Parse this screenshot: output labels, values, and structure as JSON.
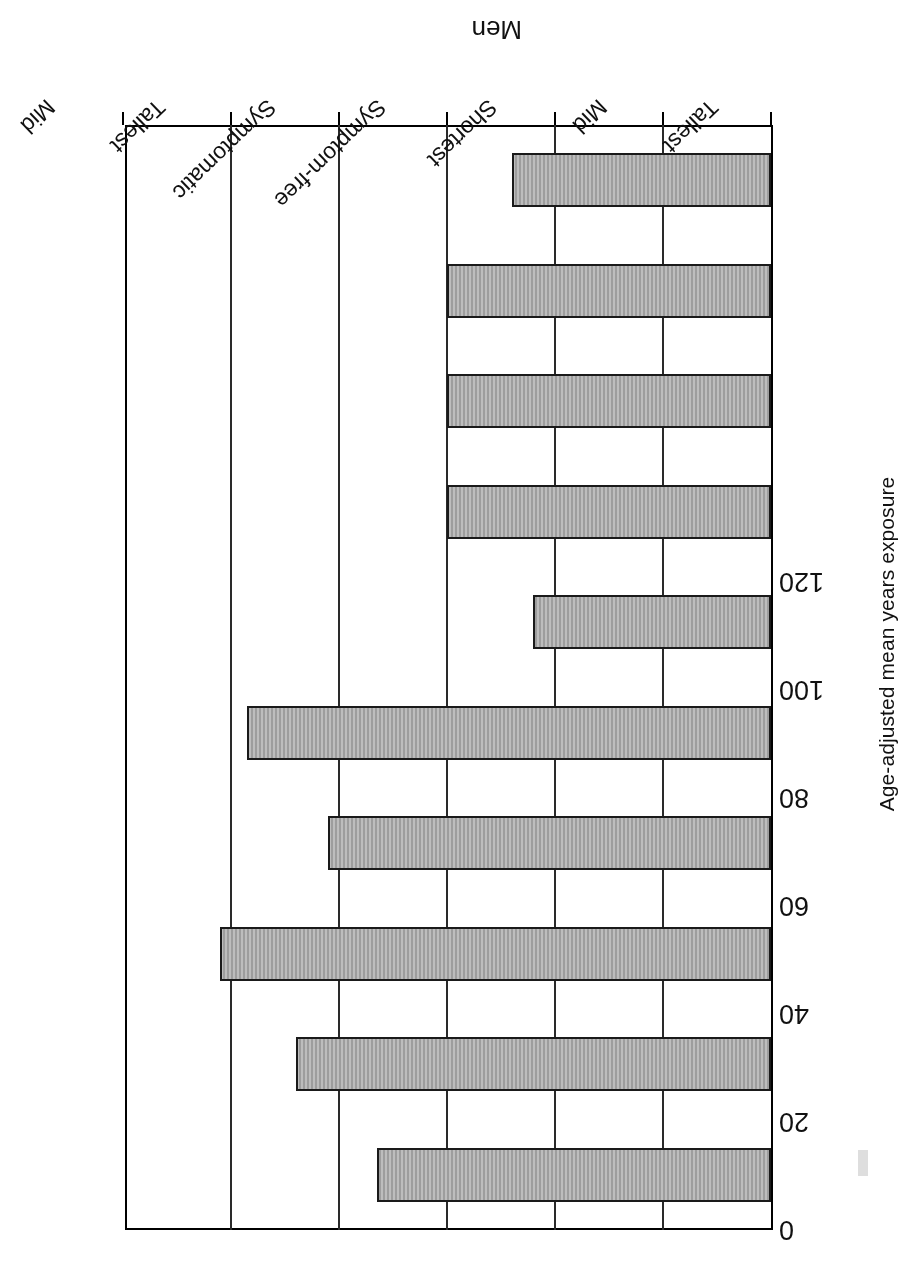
{
  "figure": {
    "axis_title": "Age-adjusted mean years exposure",
    "group_labels": [
      "Men",
      "Women"
    ],
    "bar_fill_color": "#ababab",
    "bar_edge_color": "#1a1a1a",
    "axis_color": "#000000"
  },
  "chart_data": {
    "type": "bar",
    "title": "",
    "subtitle": "",
    "orientation": "vertical",
    "xlabel": "",
    "ylabel": "Age-adjusted mean years exposure",
    "ylim": [
      0,
      120
    ],
    "yticks": [
      0,
      20,
      40,
      60,
      80,
      100,
      120
    ],
    "ytick_labels": [
      "0",
      "20",
      "40",
      "60",
      "80",
      "100",
      "120"
    ],
    "grid": true,
    "legend": "none",
    "groups": [
      "Men",
      "Women"
    ],
    "categories": [
      "Tallest",
      "Mid",
      "Shortest",
      "Symptom-free",
      "Symptomatic",
      "Tallest",
      "Mid",
      "Shortest",
      "Symptom-free",
      "Symptomatic"
    ],
    "values": [
      73,
      88,
      102,
      82,
      97,
      44,
      60,
      60,
      60,
      48
    ],
    "bars": [
      {
        "group": "Men",
        "category": "Tallest",
        "value": 73
      },
      {
        "group": "Men",
        "category": "Mid",
        "value": 88
      },
      {
        "group": "Men",
        "category": "Shortest",
        "value": 102
      },
      {
        "group": "Men",
        "category": "Symptom-free",
        "value": 82
      },
      {
        "group": "Men",
        "category": "Symptomatic",
        "value": 97
      },
      {
        "group": "Women",
        "category": "Tallest",
        "value": 44
      },
      {
        "group": "Women",
        "category": "Mid",
        "value": 60
      },
      {
        "group": "Women",
        "category": "Shortest",
        "value": 60
      },
      {
        "group": "Women",
        "category": "Symptom-free",
        "value": 60
      },
      {
        "group": "Women",
        "category": "Symptomatic",
        "value": 48
      }
    ]
  }
}
